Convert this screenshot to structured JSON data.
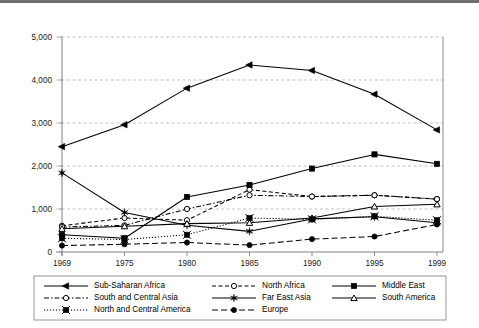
{
  "chart_data": {
    "type": "line",
    "title": "",
    "subtitle": "",
    "xlabel": "",
    "ylabel": "",
    "x": [
      "1969",
      "1975",
      "1980",
      "1985",
      "1990",
      "1995",
      "1999"
    ],
    "xlim": [
      "1969",
      "1999"
    ],
    "ylim": [
      0,
      5000
    ],
    "yticks": [
      0,
      1000,
      2000,
      3000,
      4000,
      5000
    ],
    "ytick_labels": [
      "0",
      "1,000",
      "2,000",
      "3,000",
      "4,000",
      "5,000"
    ],
    "xtick_labels": [
      "1969",
      "1975",
      "1980",
      "1985",
      "1990",
      "1995",
      "1999"
    ],
    "grid": "horizontal-dashed",
    "legend_position": "bottom",
    "series": [
      {
        "name": "Sub-Saharan Africa",
        "marker": "filled-left-triangle",
        "line_style": "solid",
        "values": [
          2450,
          2960,
          3810,
          4350,
          4220,
          3670,
          2840
        ]
      },
      {
        "name": "North Africa",
        "marker": "open-circle",
        "line_style": "dashed",
        "values": [
          610,
          790,
          740,
          1450,
          1290,
          1320,
          1230
        ]
      },
      {
        "name": "Middle East",
        "marker": "filled-square",
        "line_style": "solid",
        "values": [
          400,
          320,
          1280,
          1560,
          1940,
          2270,
          2050
        ]
      },
      {
        "name": "South and Central Asia",
        "marker": "open-circle",
        "line_style": "dash-dot",
        "values": [
          580,
          620,
          1000,
          1320,
          1290,
          1320,
          1230
        ]
      },
      {
        "name": "Far East Asia",
        "marker": "filled-star",
        "line_style": "solid",
        "values": [
          1840,
          920,
          620,
          480,
          770,
          820,
          680
        ]
      },
      {
        "name": "South America",
        "marker": "open-triangle",
        "line_style": "solid",
        "values": [
          540,
          600,
          660,
          680,
          790,
          1060,
          1110
        ]
      },
      {
        "name": "North and Central America",
        "marker": "filled-x-square",
        "line_style": "dotted",
        "values": [
          320,
          290,
          400,
          790,
          760,
          830,
          740
        ]
      },
      {
        "name": "Europe",
        "marker": "filled-circle",
        "line_style": "long-dash",
        "values": [
          150,
          180,
          220,
          160,
          300,
          360,
          640
        ]
      }
    ],
    "legend": [
      {
        "label": "Sub-Saharan Africa",
        "marker": "filled-left-triangle",
        "line_style": "solid"
      },
      {
        "label": "North Africa",
        "marker": "open-circle",
        "line_style": "dashed"
      },
      {
        "label": "Middle East",
        "marker": "filled-square",
        "line_style": "solid"
      },
      {
        "label": "South and Central Asia",
        "marker": "open-circle",
        "line_style": "dash-dot"
      },
      {
        "label": "Far East Asia",
        "marker": "filled-star",
        "line_style": "solid"
      },
      {
        "label": "South America",
        "marker": "open-triangle",
        "line_style": "solid"
      },
      {
        "label": "North and Central America",
        "marker": "filled-x-square",
        "line_style": "dotted"
      },
      {
        "label": "Europe",
        "marker": "filled-circle",
        "line_style": "long-dash"
      }
    ],
    "colors": {
      "line": "#000000",
      "grid": "#b4b4b4",
      "axis": "#808080",
      "text": "#1a1a1a",
      "background": "#ffffff"
    }
  }
}
